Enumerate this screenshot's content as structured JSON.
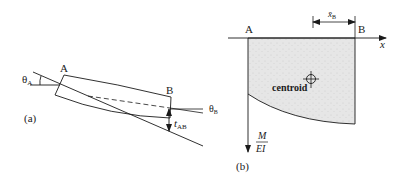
{
  "figure_a": {
    "caption": "(a)",
    "point_a": "A",
    "point_b": "B",
    "theta_a": {
      "symbol": "θ",
      "subscript": "A"
    },
    "theta_b": {
      "symbol": "θ",
      "subscript": "B"
    },
    "t_ab": {
      "symbol": "t",
      "subscript": "AB"
    }
  },
  "figure_b": {
    "caption": "(b)",
    "point_a": "A",
    "point_b": "B",
    "x_axis_label": "x",
    "x_bar": {
      "symbol": "x̄",
      "subscript": "B"
    },
    "centroid_label": "centroid",
    "y_axis_label": {
      "numerator": "M",
      "denominator": "EI"
    }
  },
  "colors": {
    "line": "#1a1a1a",
    "fill": "#e4e4e4"
  }
}
